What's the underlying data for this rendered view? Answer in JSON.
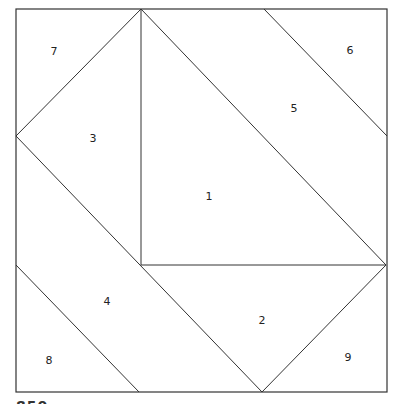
{
  "diagram": {
    "type": "quilt-block-piecing-diagram",
    "border": {
      "x": 16,
      "y": 9,
      "width": 371,
      "height": 383
    },
    "line_color": "#333333",
    "lines": [
      {
        "x1": 141,
        "y1": 9,
        "x2": 16,
        "y2": 136
      },
      {
        "x1": 16,
        "y1": 136,
        "x2": 262,
        "y2": 392
      },
      {
        "x1": 141,
        "y1": 9,
        "x2": 141,
        "y2": 265
      },
      {
        "x1": 141,
        "y1": 9,
        "x2": 386,
        "y2": 265
      },
      {
        "x1": 264,
        "y1": 9,
        "x2": 387,
        "y2": 136
      },
      {
        "x1": 141,
        "y1": 265,
        "x2": 386,
        "y2": 265
      },
      {
        "x1": 386,
        "y1": 265,
        "x2": 262,
        "y2": 392
      },
      {
        "x1": 16,
        "y1": 265,
        "x2": 139,
        "y2": 392
      }
    ],
    "pieces": [
      {
        "id": "1",
        "label": "1",
        "x": 209,
        "y": 197
      },
      {
        "id": "2",
        "label": "2",
        "x": 262,
        "y": 321
      },
      {
        "id": "3",
        "label": "3",
        "x": 93,
        "y": 139
      },
      {
        "id": "4",
        "label": "4",
        "x": 107,
        "y": 302
      },
      {
        "id": "5",
        "label": "5",
        "x": 294,
        "y": 109
      },
      {
        "id": "6",
        "label": "6",
        "x": 350,
        "y": 51
      },
      {
        "id": "7",
        "label": "7",
        "x": 54,
        "y": 52
      },
      {
        "id": "8",
        "label": "8",
        "x": 49,
        "y": 361
      },
      {
        "id": "9",
        "label": "9",
        "x": 348,
        "y": 358
      }
    ]
  },
  "footer_fragment": "850"
}
